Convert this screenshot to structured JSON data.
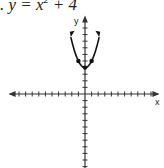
{
  "problem": {
    "prefix": ".",
    "equation_lhs": "y = x",
    "exponent": "2",
    "equation_rhs": " + 4"
  },
  "chart_data": {
    "type": "line",
    "xlabel": "x",
    "ylabel": "y",
    "function": "y = x^2 + 4",
    "points": [
      [
        -2,
        8
      ],
      [
        -1,
        5
      ],
      [
        0,
        4
      ],
      [
        1,
        5
      ],
      [
        2,
        8
      ]
    ],
    "marked_points": [
      [
        -1,
        5
      ],
      [
        0,
        4
      ],
      [
        1,
        5
      ]
    ],
    "xlim": [
      -10,
      10
    ],
    "ylim": [
      -10,
      10
    ],
    "grid": false,
    "tick_spacing": 1
  }
}
